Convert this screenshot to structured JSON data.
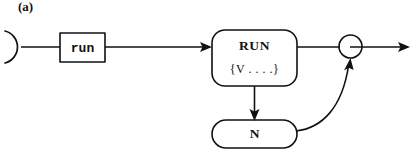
{
  "figure": {
    "label": "(a)",
    "caption_label": "(a)",
    "background_color": "#ffffff",
    "ink_color": "#111111",
    "width": 413,
    "height": 154
  },
  "nodes": {
    "start_arc": {
      "name": "start-arc",
      "shape": "open-left-arc",
      "label": ""
    },
    "event_box": {
      "name": "run-event",
      "shape": "rectangle",
      "label": "run"
    },
    "state_box": {
      "name": "RUN-state",
      "shape": "rounded-rectangle",
      "label_line1": "RUN",
      "label_line2": "{V . . . .}"
    },
    "junction": {
      "name": "merge-junction",
      "shape": "circle",
      "label": ""
    },
    "n_box": {
      "name": "N-node",
      "shape": "stadium",
      "label": "N"
    }
  },
  "edges": [
    {
      "name": "start-to-event",
      "from": "start-arc",
      "to": "run-event",
      "arrow": false,
      "style": "straight"
    },
    {
      "name": "event-to-state",
      "from": "run-event",
      "to": "RUN-state",
      "arrow": true,
      "style": "straight"
    },
    {
      "name": "state-to-junction",
      "from": "RUN-state",
      "to": "merge-junction",
      "arrow": false,
      "style": "straight"
    },
    {
      "name": "junction-to-exit",
      "from": "merge-junction",
      "to": "exit",
      "arrow": true,
      "style": "straight"
    },
    {
      "name": "state-to-n",
      "from": "RUN-state",
      "to": "N-node",
      "arrow": true,
      "style": "straight-vertical"
    },
    {
      "name": "n-to-junction",
      "from": "N-node",
      "to": "merge-junction",
      "arrow": true,
      "style": "curved-feedback"
    }
  ]
}
